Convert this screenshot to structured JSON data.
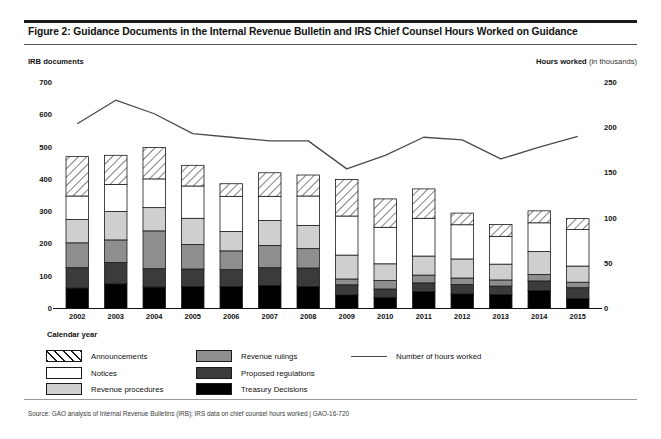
{
  "figure": {
    "title": "Figure 2: Guidance Documents in the Internal Revenue Bulletin and IRS Chief Counsel Hours Worked on Guidance",
    "source": "Source: GAO analysis of Internal Revenue Bulletins (IRB); IRS data on chief counsel hours worked  |  GAO-16-720"
  },
  "axes": {
    "left_caption": "IRB documents",
    "right_caption_bold": "Hours worked",
    "right_caption_unit": "(in thousands)",
    "x_caption": "Calendar year",
    "left_ticks": [
      "700",
      "600",
      "500",
      "400",
      "300",
      "200",
      "100",
      "0"
    ],
    "right_ticks": [
      "250",
      "200",
      "150",
      "100",
      "50",
      "0"
    ]
  },
  "legend": {
    "column1": [
      {
        "label": "Announcements",
        "key": "announcements"
      },
      {
        "label": "Notices",
        "key": "notices"
      },
      {
        "label": "Revenue procedures",
        "key": "revenue_procedures"
      }
    ],
    "column2": [
      {
        "label": "Revenue rulings",
        "key": "revenue_rulings"
      },
      {
        "label": "Proposed regulations",
        "key": "proposed_regulations"
      },
      {
        "label": "Treasury Decisions",
        "key": "treasury_decisions"
      }
    ],
    "column3": [
      {
        "label": "Number of hours worked",
        "key": "hours_worked"
      }
    ]
  },
  "colors": {
    "announcements": "#ffffff",
    "notices": "#ffffff",
    "revenue_procedures": "#cfcfcf",
    "revenue_rulings": "#8e8e8e",
    "proposed_regulations": "#3b3b3b",
    "treasury_decisions": "#000000",
    "line": "#4a4a4a",
    "axis": "#111111"
  },
  "chart_data": {
    "type": "bar",
    "subtype": "stacked-bar-with-line",
    "title": "Figure 2: Guidance Documents in the Internal Revenue Bulletin and IRS Chief Counsel Hours Worked on Guidance",
    "xlabel": "Calendar year",
    "ylabel": "IRB documents",
    "y2label": "Hours worked (in thousands)",
    "ylim": [
      0,
      700
    ],
    "y2lim": [
      0,
      250
    ],
    "ytick_step": 100,
    "y2tick_step": 50,
    "grid": false,
    "legend_position": "below",
    "categories": [
      "2002",
      "2003",
      "2004",
      "2005",
      "2006",
      "2007",
      "2008",
      "2009",
      "2010",
      "2011",
      "2012",
      "2013",
      "2014",
      "2015"
    ],
    "series": [
      {
        "name": "Treasury Decisions",
        "axis": "left",
        "stack_order": 1,
        "values": [
          65,
          78,
          68,
          70,
          70,
          73,
          70,
          44,
          36,
          54,
          47,
          45,
          57,
          33
        ]
      },
      {
        "name": "Proposed regulations",
        "axis": "left",
        "stack_order": 2,
        "values": [
          63,
          66,
          57,
          54,
          52,
          55,
          57,
          31,
          26,
          27,
          29,
          26,
          30,
          33
        ]
      },
      {
        "name": "Revenue rulings",
        "axis": "left",
        "stack_order": 3,
        "values": [
          77,
          70,
          117,
          76,
          58,
          69,
          60,
          18,
          26,
          24,
          20,
          19,
          20,
          17
        ]
      },
      {
        "name": "Revenue procedures",
        "axis": "left",
        "stack_order": 4,
        "values": [
          72,
          88,
          72,
          81,
          60,
          77,
          72,
          74,
          52,
          59,
          59,
          49,
          71,
          50
        ]
      },
      {
        "name": "Notices",
        "axis": "left",
        "stack_order": 5,
        "values": [
          73,
          84,
          89,
          100,
          109,
          75,
          91,
          121,
          113,
          117,
          106,
          86,
          89,
          113
        ]
      },
      {
        "name": "Announcements",
        "axis": "left",
        "stack_order": 6,
        "values": [
          122,
          90,
          97,
          64,
          39,
          73,
          65,
          113,
          88,
          91,
          36,
          37,
          37,
          34
        ]
      }
    ],
    "stacked_totals": [
      472,
      476,
      500,
      445,
      388,
      422,
      415,
      401,
      341,
      372,
      297,
      262,
      304,
      280
    ],
    "line_series": {
      "name": "Number of hours worked",
      "axis": "right",
      "unit": "thousands of hours",
      "values": [
        205,
        231,
        216,
        194,
        190,
        186,
        186,
        155,
        170,
        190,
        187,
        166,
        179,
        191
      ]
    }
  }
}
